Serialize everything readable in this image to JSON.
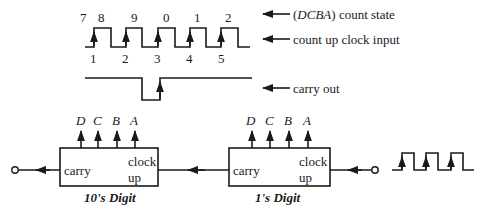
{
  "legend": {
    "count_state": "(DCBA) count state",
    "count_state_parts": {
      "open": "(",
      "vars": "DCBA",
      "close": ") count state"
    },
    "clock_input": "count up clock input",
    "carry_out": "carry out"
  },
  "waveform": {
    "states": [
      "7",
      "8",
      "9",
      "0",
      "1",
      "2"
    ],
    "pulse_numbers": [
      "1",
      "2",
      "3",
      "4",
      "5"
    ]
  },
  "counters": {
    "tens": {
      "caption": "10's Digit",
      "outputs": [
        "D",
        "C",
        "B",
        "A"
      ],
      "carry_label": "carry",
      "clock_label_1": "clock",
      "clock_label_2": "up"
    },
    "ones": {
      "caption": "1's Digit",
      "outputs": [
        "D",
        "C",
        "B",
        "A"
      ],
      "carry_label": "carry",
      "clock_label_1": "clock",
      "clock_label_2": "up"
    }
  },
  "colors": {
    "ink": "#1a1a1a",
    "background": "#ffffff"
  }
}
